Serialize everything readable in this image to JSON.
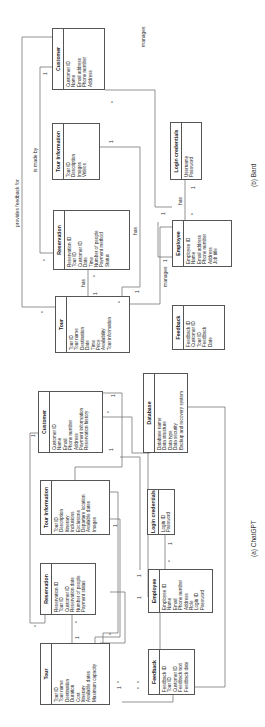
{
  "figure": {
    "captions": {
      "chatgpt": "(a) ChatGPT",
      "bard": "(b) Bard"
    }
  },
  "chatgpt": {
    "entities": {
      "tour": {
        "title": "Tour",
        "attributes": [
          "Tour ID",
          "Tour name",
          "Destination",
          "Duration",
          "Cost",
          "Itinerary",
          "Available dates",
          "Maximum capacity"
        ]
      },
      "reservation": {
        "title": "Reservation",
        "attributes": [
          "Reservation ID",
          "Tour ID",
          "Customer ID",
          "Reservation date",
          "Number of people",
          "Payment status"
        ]
      },
      "tour_information": {
        "title": "Tour Information",
        "attributes": [
          "Tour ID",
          "Description",
          "Itinerary",
          "Inclusions",
          "Exclusions",
          "Departure location",
          "Available dates",
          "Images"
        ]
      },
      "customer": {
        "title": "Customer",
        "attributes": [
          "Customer ID",
          "Name",
          "Email",
          "Phone number",
          "Address",
          "Payment information",
          "Reservation history"
        ]
      },
      "database": {
        "title": "Database",
        "attributes": [
          "Database name",
          "Data structure",
          "Data type",
          "Data security",
          "Backup and recovery system"
        ]
      },
      "login_credentials": {
        "title": "Login credentials",
        "attributes": [
          "Login ID",
          "Password"
        ]
      },
      "employee": {
        "title": "Employee",
        "attributes": [
          "Employee ID",
          "Name",
          "Email",
          "Phone number",
          "Address",
          "Role",
          "Login ID",
          "Password"
        ]
      },
      "feedback": {
        "title": "Feedback",
        "attributes": [
          "Feedback ID",
          "Tour ID",
          "Customer ID",
          "Feedback text",
          "Feedback date"
        ]
      }
    },
    "multiplicities": {
      "tour_res_tour": "1",
      "tour_res_res": "*",
      "cust_res_cust": "1",
      "cust_res_res": "*",
      "tinfo_tour": "1",
      "tinfo_tour2": "1",
      "emp_login_emp": "*",
      "emp_login_login": "1",
      "emp_tour_emp": "1",
      "emp_tour_tour": "*",
      "fb_tour_a": "1",
      "fb_tour_b": "*",
      "fb_tour_c": "*",
      "fb_tour_d": "*",
      "cust_db": "*",
      "emp_cust": "1",
      "emp_db": "1"
    }
  },
  "bard": {
    "entities": {
      "tour": {
        "title": "Tour",
        "attributes": [
          "Tour ID",
          "Tour name",
          "Destination",
          "Date",
          "Time",
          "Price",
          "Availability",
          "Tour information"
        ]
      },
      "reservation": {
        "title": "Reservation",
        "attributes": [
          "Reservation ID",
          "Tour ID",
          "Customer ID",
          "Date",
          "Time",
          "Number of people",
          "Payment method",
          "Status"
        ]
      },
      "tour_information": {
        "title": "Tour Information",
        "attributes": [
          "Tour ID",
          "Description",
          "Images",
          "Videos"
        ]
      },
      "customer": {
        "title": "Customer",
        "attributes": [
          "Customer ID",
          "Name",
          "Email address",
          "Phone number",
          "Address"
        ]
      },
      "login_credentials": {
        "title": "Login credentials",
        "attributes": [
          "Username",
          "Password"
        ]
      },
      "employee": {
        "title": "Employee",
        "attributes": [
          "Employee ID",
          "Name",
          "Email address",
          "Phone number",
          "Address",
          "Job title"
        ]
      },
      "feedback": {
        "title": "Feedback",
        "attributes": [
          "Feedback ID",
          "Customer ID",
          "Tour ID",
          "Feedback",
          "Date"
        ]
      }
    },
    "relations": {
      "provides_feedback_for": "provides feedback for",
      "is_made_by": "is made by",
      "has_tour_res": "has",
      "has_res_tinfo": "has",
      "manages_emp_tour": "manages",
      "has_emp_login": "has",
      "manages_cust": "manages"
    },
    "multiplicities": {
      "pf_tour": "*",
      "imb_cust": "1",
      "imb_res": "*",
      "has_tour": "1",
      "has_res": "*",
      "tinfo_1": "1",
      "tinfo_tour": "1",
      "emp_tour_emp": "1",
      "emp_tour_tour": "*",
      "emp_login_emp": "*",
      "emp_login_login": "1",
      "cust_emp": "*",
      "cust_emp_1": "1"
    }
  }
}
